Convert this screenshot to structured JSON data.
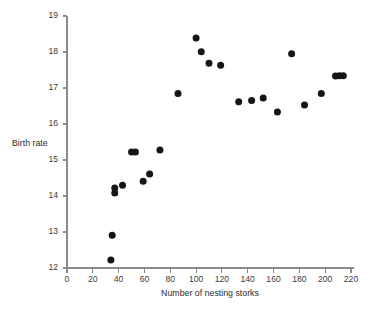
{
  "chart_data": {
    "type": "scatter",
    "title": "",
    "xlabel": "Number of nesting storks",
    "ylabel": "Birth rate",
    "xlim": [
      0,
      220
    ],
    "ylim": [
      12,
      19
    ],
    "xticks": [
      0,
      20,
      40,
      60,
      80,
      100,
      120,
      140,
      160,
      180,
      200,
      220
    ],
    "yticks": [
      12,
      13,
      14,
      15,
      16,
      17,
      18,
      19
    ],
    "grid": false,
    "legend": null,
    "marker": "filled-circle",
    "marker_color": "#151515",
    "points": [
      {
        "x": 34,
        "y": 12.22
      },
      {
        "x": 35,
        "y": 12.91
      },
      {
        "x": 37,
        "y": 14.08
      },
      {
        "x": 37,
        "y": 14.22
      },
      {
        "x": 43,
        "y": 14.3
      },
      {
        "x": 50,
        "y": 15.22
      },
      {
        "x": 53,
        "y": 15.22
      },
      {
        "x": 59,
        "y": 14.41
      },
      {
        "x": 64,
        "y": 14.61
      },
      {
        "x": 72,
        "y": 15.28
      },
      {
        "x": 86,
        "y": 16.85
      },
      {
        "x": 100,
        "y": 18.39
      },
      {
        "x": 104,
        "y": 18.01
      },
      {
        "x": 110,
        "y": 17.69
      },
      {
        "x": 119,
        "y": 17.63
      },
      {
        "x": 133,
        "y": 16.62
      },
      {
        "x": 143,
        "y": 16.65
      },
      {
        "x": 152,
        "y": 16.72
      },
      {
        "x": 163,
        "y": 16.33
      },
      {
        "x": 174,
        "y": 17.95
      },
      {
        "x": 184,
        "y": 16.53
      },
      {
        "x": 197,
        "y": 16.85
      },
      {
        "x": 208,
        "y": 17.33
      },
      {
        "x": 211,
        "y": 17.34
      },
      {
        "x": 214,
        "y": 17.34
      }
    ]
  },
  "axes": {
    "axis_color": "#8a8a8a",
    "tick_label_color": "#3a3a3a"
  }
}
